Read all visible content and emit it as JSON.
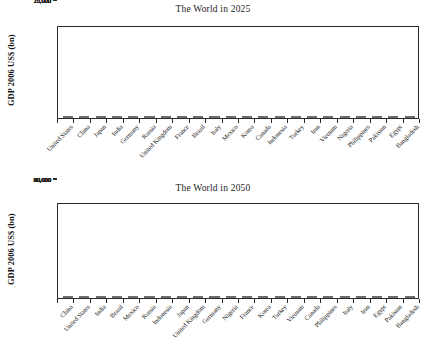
{
  "chart_data": [
    {
      "type": "bar",
      "title": "The World in 2025",
      "xlabel": "",
      "ylabel": "GDP 2006 US$ (bn)",
      "ylim": [
        0,
        25000
      ],
      "yticks": [
        0,
        5000,
        10000,
        15000,
        20000,
        25000
      ],
      "ytick_labels": [
        "0",
        "5,000",
        "10,000",
        "15,000",
        "20,000",
        "25,000"
      ],
      "grid": false,
      "legend": "none",
      "categories": [
        "United States",
        "China",
        "Japan",
        "India",
        "Germany",
        "Russia",
        "United Kingdom",
        "France",
        "Brazil",
        "Italy",
        "Mexico",
        "Korea",
        "Canada",
        "Indonesia",
        "Turkey",
        "Iran",
        "Vietnam",
        "Nigeria",
        "Philippines",
        "Pakistan",
        "Egypt",
        "Bangladesh"
      ],
      "values": [
        20000,
        18400,
        5700,
        4400,
        3700,
        3500,
        3400,
        3100,
        2950,
        2400,
        2400,
        2000,
        2000,
        1200,
        1050,
        800,
        450,
        420,
        400,
        400,
        420,
        300
      ]
    },
    {
      "type": "bar",
      "title": "The World in 2050",
      "xlabel": "",
      "ylabel": "GDP 2006 US$ (bn)",
      "ylim": [
        0,
        80000
      ],
      "yticks": [
        0,
        10000,
        20000,
        30000,
        40000,
        50000,
        60000,
        70000,
        80000
      ],
      "ytick_labels": [
        "0",
        "10,000",
        "20,000",
        "30,000",
        "40,000",
        "50,000",
        "60,000",
        "70,000",
        "80,000"
      ],
      "grid": false,
      "legend": "none",
      "categories": [
        "China",
        "United States",
        "India",
        "Brazil",
        "Mexico",
        "Russia",
        "Indonesia",
        "Japan",
        "United Kingdom",
        "Germany",
        "Nigeria",
        "France",
        "Korea",
        "Turkey",
        "Vietnam",
        "Canada",
        "Philippines",
        "Italy",
        "Iran",
        "Egypt",
        "Pakistan",
        "Bangladesh"
      ],
      "values": [
        70700,
        38500,
        38300,
        11500,
        9300,
        8600,
        7200,
        6700,
        5400,
        5300,
        4800,
        4700,
        4400,
        4000,
        3800,
        3700,
        3300,
        3000,
        3000,
        2800,
        1600,
        1400
      ]
    }
  ],
  "charts": {
    "top": {
      "title": "The World in 2025",
      "ylabel": "GDP 2006 US$ (bn)"
    },
    "bottom": {
      "title": "The World in 2050",
      "ylabel": "GDP 2006 US$ (bn)"
    }
  },
  "colors": {
    "bar_fill": "#818181",
    "bar_stroke": "#6d6d6d",
    "axis": "#2a2a2a",
    "text": "#1b1b1b",
    "background": "#ffffff"
  }
}
